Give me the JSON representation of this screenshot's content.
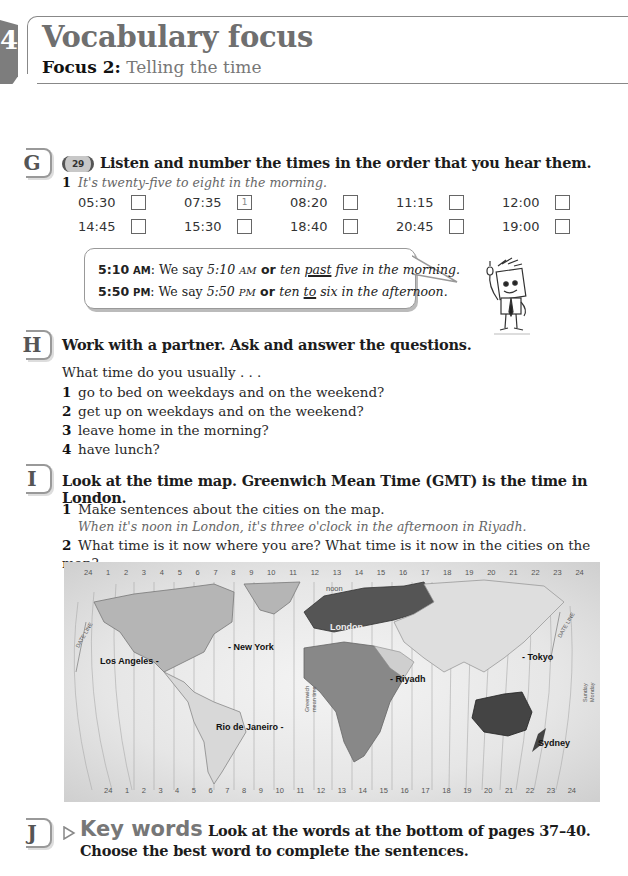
{
  "header": {
    "unit_number": "4",
    "title": "Vocabulary focus",
    "focus_label": "Focus 2:",
    "focus_title": "Telling the time"
  },
  "section_g": {
    "letter": "G",
    "track_number": "29",
    "instruction": "Listen and number the times in the order that you hear them.",
    "example_number": "1",
    "example_text": "It's twenty-five to eight in the morning.",
    "times": [
      [
        {
          "time": "05:30",
          "answer": ""
        },
        {
          "time": "07:35",
          "answer": "1"
        },
        {
          "time": "08:20",
          "answer": ""
        },
        {
          "time": "11:15",
          "answer": ""
        },
        {
          "time": "12:00",
          "answer": ""
        }
      ],
      [
        {
          "time": "14:45",
          "answer": ""
        },
        {
          "time": "15:30",
          "answer": ""
        },
        {
          "time": "18:40",
          "answer": ""
        },
        {
          "time": "20:45",
          "answer": ""
        },
        {
          "time": "19:00",
          "answer": ""
        }
      ]
    ]
  },
  "tip_bubble": {
    "line1": {
      "time": "5:10",
      "period": "AM",
      "we_say": ": We say ",
      "numeric": "5:10",
      "numeric_period": "AM",
      "or": " or ",
      "pre": "ten ",
      "key": "past",
      "post": " five in the morning."
    },
    "line2": {
      "time": "5:50",
      "period": "PM",
      "we_say": ": We say ",
      "numeric": "5:50",
      "numeric_period": "PM",
      "or": " or ",
      "pre": "ten ",
      "key": "to",
      "post": " six in the afternoon."
    }
  },
  "section_h": {
    "letter": "H",
    "instruction": "Work with a partner. Ask and answer the questions.",
    "lead": "What time do you usually . . .",
    "questions": [
      {
        "n": "1",
        "text": "go to bed on weekdays and on the weekend?"
      },
      {
        "n": "2",
        "text": "get up on weekdays and on the weekend?"
      },
      {
        "n": "3",
        "text": "leave home in the morning?"
      },
      {
        "n": "4",
        "text": "have lunch?"
      }
    ]
  },
  "section_i": {
    "letter": "I",
    "instruction": "Look at the time map. Greenwich Mean Time (GMT) is the time in London.",
    "items": [
      {
        "n": "1",
        "text": "Make sentences about the cities on the map.",
        "example": "When it's noon in London, it's three o'clock in the afternoon in Riyadh."
      },
      {
        "n": "2",
        "text": "What time is it now where you are? What time is it now in the cities on the map?"
      }
    ]
  },
  "map": {
    "top_hours": [
      "24",
      "1",
      "2",
      "3",
      "4",
      "5",
      "6",
      "7",
      "8",
      "9",
      "10",
      "11",
      "12",
      "13",
      "14",
      "15",
      "16",
      "17",
      "18",
      "19",
      "20",
      "21",
      "22",
      "23",
      "24"
    ],
    "bottom_hours": [
      "24",
      "1",
      "2",
      "3",
      "4",
      "5",
      "6",
      "7",
      "8",
      "9",
      "10",
      "11",
      "12",
      "13",
      "14",
      "15",
      "16",
      "17",
      "18",
      "19",
      "20",
      "21",
      "22",
      "23",
      "24"
    ],
    "noon_label": "noon",
    "cities": {
      "los_angeles": "Los Angeles",
      "new_york": "New York",
      "london": "London",
      "riyadh": "Riyadh",
      "tokyo": "Tokyo",
      "rio": "Rio de Janeiro",
      "sydney": "Sydney"
    },
    "date_line_left": "DATE LINE",
    "date_line_right": "DATE LINE",
    "greenwich_label": "Greenwich",
    "greenwich_sub": "mean time",
    "sunday": "Sunday",
    "monday": "Monday"
  },
  "section_j": {
    "letter": "J",
    "key_words_label": "Key words",
    "instruction": "Look at the words at the bottom of pages 37–40. Choose the best word to complete the sentences."
  }
}
